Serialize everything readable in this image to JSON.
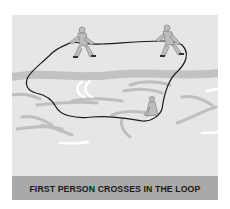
{
  "illustration": {
    "caption": "FIRST PERSON CROSSES IN THE LOOP",
    "colors": {
      "background": "#e6e6e6",
      "water_band": "#c4c4c4",
      "caption_bar": "#a9a9a9",
      "caption_text": "#1a1a1a",
      "rope": "#1a1a1a",
      "figures": "#bdbdbd"
    },
    "figures": [
      {
        "id": "anchor-left",
        "role": "person holding rope on bank"
      },
      {
        "id": "anchor-right",
        "role": "person holding rope on bank"
      },
      {
        "id": "crosser",
        "role": "person crossing in the loop"
      }
    ]
  }
}
